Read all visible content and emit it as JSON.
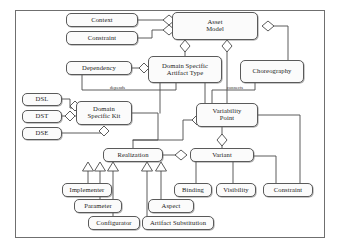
{
  "diagram": {
    "type": "uml-class-diagram",
    "stroke_color": "#5a5a5a",
    "fill_color": "#fbfbfb",
    "text_color": "#1a1a1a",
    "nodes": [
      {
        "id": "context",
        "label": "Context",
        "x": 66,
        "y": 13,
        "w": 72,
        "h": 14
      },
      {
        "id": "constraint_top",
        "label": "Constraint",
        "x": 66,
        "y": 31,
        "w": 72,
        "h": 14
      },
      {
        "id": "asset_model",
        "label": "Asset\nModel",
        "x": 172,
        "y": 12,
        "w": 86,
        "h": 28
      },
      {
        "id": "dependency",
        "label": "Dependency",
        "x": 66,
        "y": 61,
        "w": 66,
        "h": 14
      },
      {
        "id": "dsat",
        "label": "Domain Specific\nArtifact Type",
        "x": 148,
        "y": 56,
        "w": 74,
        "h": 27
      },
      {
        "id": "choreography",
        "label": "Choreography",
        "x": 240,
        "y": 60,
        "w": 64,
        "h": 23
      },
      {
        "id": "dsl",
        "label": "DSL",
        "x": 22,
        "y": 93,
        "w": 40,
        "h": 13
      },
      {
        "id": "dst",
        "label": "DST",
        "x": 22,
        "y": 110,
        "w": 40,
        "h": 13
      },
      {
        "id": "dse",
        "label": "DSE",
        "x": 22,
        "y": 127,
        "w": 40,
        "h": 13
      },
      {
        "id": "dsk",
        "label": "Domain\nSpecific Kit",
        "x": 76,
        "y": 101,
        "w": 56,
        "h": 24
      },
      {
        "id": "vp",
        "label": "Variability\nPoint",
        "x": 196,
        "y": 103,
        "w": 62,
        "h": 24
      },
      {
        "id": "realization",
        "label": "Realization",
        "x": 103,
        "y": 148,
        "w": 60,
        "h": 14
      },
      {
        "id": "variant",
        "label": "Variant",
        "x": 190,
        "y": 148,
        "w": 64,
        "h": 14
      },
      {
        "id": "binding",
        "label": "Binding",
        "x": 174,
        "y": 183,
        "w": 38,
        "h": 14
      },
      {
        "id": "visibility",
        "label": "Visibility",
        "x": 216,
        "y": 183,
        "w": 40,
        "h": 14
      },
      {
        "id": "constraint_r",
        "label": "Constraint",
        "x": 263,
        "y": 183,
        "w": 50,
        "h": 14
      },
      {
        "id": "implementer",
        "label": "Implementer",
        "x": 62,
        "y": 183,
        "w": 50,
        "h": 14
      },
      {
        "id": "parameter",
        "label": "Parameter",
        "x": 74,
        "y": 199,
        "w": 48,
        "h": 14
      },
      {
        "id": "aspect",
        "label": "Aspect",
        "x": 148,
        "y": 199,
        "w": 46,
        "h": 14
      },
      {
        "id": "configurator",
        "label": "Configurator",
        "x": 88,
        "y": 216,
        "w": 52,
        "h": 14
      },
      {
        "id": "artifact_sub",
        "label": "Artifact Substitution",
        "x": 142,
        "y": 216,
        "w": 72,
        "h": 14
      }
    ],
    "edge_labels": [
      {
        "id": "depends",
        "text": "depends",
        "x": 110,
        "y": 85
      },
      {
        "id": "connects",
        "text": "connects",
        "x": 227,
        "y": 85
      }
    ],
    "relationships": [
      {
        "from": "context",
        "to": "asset_model",
        "type": "aggregation"
      },
      {
        "from": "constraint_top",
        "to": "asset_model",
        "type": "aggregation"
      },
      {
        "from": "asset_model",
        "to": "dsat",
        "type": "aggregation"
      },
      {
        "from": "asset_model",
        "to": "vp",
        "type": "aggregation"
      },
      {
        "from": "asset_model",
        "to": "choreography",
        "type": "aggregation"
      },
      {
        "from": "dependency",
        "to": "dsat",
        "type": "aggregation"
      },
      {
        "from": "dependency",
        "to": "dsk",
        "type": "association",
        "label": "depends"
      },
      {
        "from": "choreography",
        "to": "vp",
        "type": "association",
        "label": "connects"
      },
      {
        "from": "dsl",
        "to": "dsk",
        "type": "aggregation"
      },
      {
        "from": "dst",
        "to": "dsk",
        "type": "aggregation"
      },
      {
        "from": "dse",
        "to": "dsk",
        "type": "aggregation"
      },
      {
        "from": "dsk",
        "to": "realization",
        "type": "association"
      },
      {
        "from": "dsat",
        "to": "realization",
        "type": "association"
      },
      {
        "from": "vp",
        "to": "realization",
        "type": "aggregation"
      },
      {
        "from": "vp",
        "to": "variant",
        "type": "aggregation"
      },
      {
        "from": "realization",
        "to": "variant",
        "type": "aggregation"
      },
      {
        "from": "variant",
        "to": "binding",
        "type": "association"
      },
      {
        "from": "variant",
        "to": "visibility",
        "type": "association"
      },
      {
        "from": "variant",
        "to": "constraint_r",
        "type": "association"
      },
      {
        "from": "implementer",
        "to": "realization",
        "type": "generalization"
      },
      {
        "from": "parameter",
        "to": "realization",
        "type": "generalization"
      },
      {
        "from": "configurator",
        "to": "realization",
        "type": "generalization"
      },
      {
        "from": "artifact_sub",
        "to": "realization",
        "type": "generalization"
      },
      {
        "from": "aspect",
        "to": "realization",
        "type": "generalization"
      }
    ]
  }
}
